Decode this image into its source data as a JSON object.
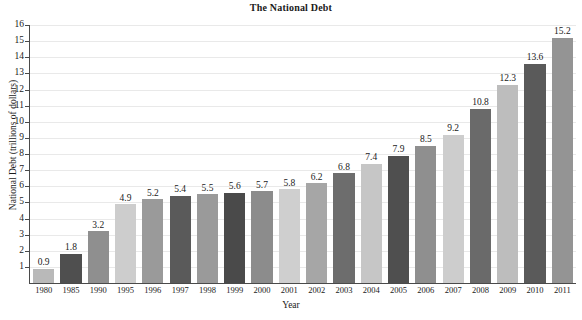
{
  "chart_data": {
    "type": "bar",
    "title": "The National Debt",
    "xlabel": "Year",
    "ylabel": "National Debt (trillions of dollars)",
    "ylim": [
      0,
      16
    ],
    "yticks": [
      1,
      2,
      3,
      4,
      5,
      6,
      7,
      8,
      9,
      10,
      11,
      12,
      13,
      14,
      15,
      16
    ],
    "grid": true,
    "legend": "none",
    "categories": [
      "1980",
      "1985",
      "1990",
      "1995",
      "1996",
      "1997",
      "1998",
      "1999",
      "2000",
      "2001",
      "2002",
      "2003",
      "2004",
      "2005",
      "2006",
      "2007",
      "2008",
      "2009",
      "2010",
      "2011"
    ],
    "values": [
      0.9,
      1.8,
      3.2,
      4.9,
      5.2,
      5.4,
      5.5,
      5.6,
      5.7,
      5.8,
      6.2,
      6.8,
      7.4,
      7.9,
      8.5,
      9.2,
      10.8,
      12.3,
      13.6,
      15.2
    ],
    "bar_colors": [
      "#b9b9b9",
      "#4f4f4f",
      "#8f8f8f",
      "#cdcdcd",
      "#9a9a9a",
      "#5a5a5a",
      "#9a9a9a",
      "#4a4a4a",
      "#8c8c8c",
      "#cfcfcf",
      "#a6a6a6",
      "#6d6d6d",
      "#c6c6c6",
      "#4f4f4f",
      "#8f8f8f",
      "#cdcdcd",
      "#6a6a6a",
      "#bdbdbd",
      "#5a5a5a",
      "#949494"
    ],
    "axis_color": "#4a4a4a",
    "gridline_color": "#e9e9e9",
    "text_color": "#1a1a1a"
  }
}
